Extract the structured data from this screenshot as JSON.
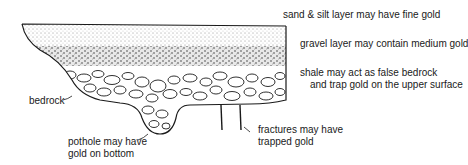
{
  "diagram": {
    "labels": {
      "sand_silt": "sand & silt layer may have fine gold",
      "gravel": "gravel layer may contain medium gold",
      "shale_line1": "shale may act as false bedrock",
      "shale_line2": "and trap gold on the upper surface",
      "bedrock": "bedrock",
      "pothole_line1": "pothole may have",
      "pothole_line2": "gold on bottom",
      "fractures_line1": "fractures may have",
      "fractures_line2": "trapped gold"
    },
    "colors": {
      "ink": "#1a1a1a",
      "background": "#ffffff"
    }
  }
}
